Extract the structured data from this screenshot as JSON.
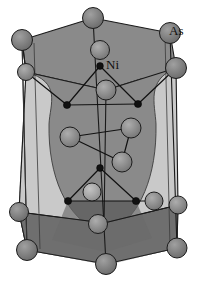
{
  "figure": {
    "name": "nias-crystal-structure",
    "type": "crystal-structure-diagram",
    "width": 198,
    "height": 283
  },
  "labels": {
    "arsenic": "As",
    "nickel": "Ni"
  },
  "colors": {
    "background": "#ffffff",
    "face_light": "#c9c9c9",
    "face_mid": "#8a8a8a",
    "face_dark": "#6f6f6f",
    "face_darkest": "#5f5f5f",
    "atom_as_fill": "#858585",
    "atom_as_stroke": "#1c1c1c",
    "atom_ni_fill": "#111111",
    "atom_ni_stroke": "#000000",
    "bond_stroke": "#111111",
    "edge_stroke": "#1a1a1a",
    "label_text": "#111111"
  },
  "geometry": {
    "prism_top_outline": [
      [
        22,
        40
      ],
      [
        93,
        18
      ],
      [
        170,
        33
      ],
      [
        176,
        68
      ],
      [
        106,
        90
      ],
      [
        26,
        72
      ]
    ],
    "prism_bottom_outline": [
      [
        27,
        250
      ],
      [
        106,
        264
      ],
      [
        177,
        248
      ],
      [
        178,
        205
      ],
      [
        104,
        223
      ],
      [
        19,
        212
      ]
    ],
    "vertical_edges": [
      [
        [
          22,
          40
        ],
        [
          27,
          250
        ]
      ],
      [
        [
          93,
          18
        ],
        [
          106,
          264
        ]
      ],
      [
        [
          170,
          33
        ],
        [
          177,
          248
        ]
      ],
      [
        [
          176,
          68
        ],
        [
          178,
          205
        ]
      ],
      [
        [
          26,
          72
        ],
        [
          19,
          212
        ]
      ],
      [
        [
          106,
          90
        ],
        [
          104,
          223
        ]
      ]
    ]
  },
  "atoms": {
    "as_label_key": "As",
    "ni_label_key": "Ni",
    "as_sites": [
      {
        "id": "as-top-left-back",
        "x": 22,
        "y": 40,
        "r": 10.5,
        "shade": "dark"
      },
      {
        "id": "as-top-center-back",
        "x": 93,
        "y": 18,
        "r": 10.5,
        "shade": "dark"
      },
      {
        "id": "as-top-right-back",
        "x": 170,
        "y": 33,
        "r": 10.5,
        "shade": "dark"
      },
      {
        "id": "as-top-right-front",
        "x": 176,
        "y": 68,
        "r": 10.5,
        "shade": "dark"
      },
      {
        "id": "as-top-left-front",
        "x": 26,
        "y": 72,
        "r": 8.5,
        "shade": "mid"
      },
      {
        "id": "as-top-center-front",
        "x": 100,
        "y": 50,
        "r": 9.5,
        "shade": "mid"
      },
      {
        "id": "as-upper-apex",
        "x": 106,
        "y": 90,
        "r": 10.0,
        "shade": "mid"
      },
      {
        "id": "as-mid-left",
        "x": 70,
        "y": 137,
        "r": 10.0,
        "shade": "mid"
      },
      {
        "id": "as-mid-right",
        "x": 131,
        "y": 128,
        "r": 10.0,
        "shade": "mid"
      },
      {
        "id": "as-mid-lower",
        "x": 122,
        "y": 162,
        "r": 10.0,
        "shade": "mid"
      },
      {
        "id": "as-lower-apex",
        "x": 92,
        "y": 192,
        "r": 9.0,
        "shade": "light"
      },
      {
        "id": "as-lower-center",
        "x": 98,
        "y": 224,
        "r": 9.5,
        "shade": "mid"
      },
      {
        "id": "as-bottom-left-front",
        "x": 19,
        "y": 212,
        "r": 9.5,
        "shade": "dark"
      },
      {
        "id": "as-bottom-right-front",
        "x": 154,
        "y": 201,
        "r": 9.0,
        "shade": "mid"
      },
      {
        "id": "as-bottom-left-back",
        "x": 27,
        "y": 250,
        "r": 10.5,
        "shade": "dark"
      },
      {
        "id": "as-bottom-center",
        "x": 106,
        "y": 264,
        "r": 10.5,
        "shade": "dark"
      },
      {
        "id": "as-bottom-right-back",
        "x": 177,
        "y": 248,
        "r": 10.0,
        "shade": "dark"
      },
      {
        "id": "as-right-mid",
        "x": 178,
        "y": 205,
        "r": 9.0,
        "shade": "mid"
      }
    ],
    "ni_sites": [
      {
        "id": "ni-top-apex",
        "x": 100,
        "y": 66,
        "r": 3.4
      },
      {
        "id": "ni-upper-left",
        "x": 67,
        "y": 105,
        "r": 3.6
      },
      {
        "id": "ni-upper-right",
        "x": 138,
        "y": 104,
        "r": 3.6
      },
      {
        "id": "ni-lower-apex",
        "x": 100,
        "y": 168,
        "r": 3.4
      },
      {
        "id": "ni-lower-left",
        "x": 68,
        "y": 201,
        "r": 3.6
      },
      {
        "id": "ni-lower-right",
        "x": 136,
        "y": 201,
        "r": 3.6
      }
    ],
    "bonds": [
      {
        "from": "ni-top-apex",
        "to": "ni-upper-left"
      },
      {
        "from": "ni-top-apex",
        "to": "ni-upper-right"
      },
      {
        "from": "ni-upper-left",
        "to": "ni-upper-right"
      },
      {
        "from": "ni-lower-apex",
        "to": "ni-lower-left"
      },
      {
        "from": "ni-lower-apex",
        "to": "ni-lower-right"
      },
      {
        "from": "ni-lower-left",
        "to": "ni-lower-right"
      },
      {
        "from": "as-mid-left",
        "to": "as-mid-right"
      },
      {
        "from": "as-mid-right",
        "to": "as-mid-lower"
      },
      {
        "from": "as-mid-left",
        "to": "as-mid-lower"
      }
    ]
  }
}
